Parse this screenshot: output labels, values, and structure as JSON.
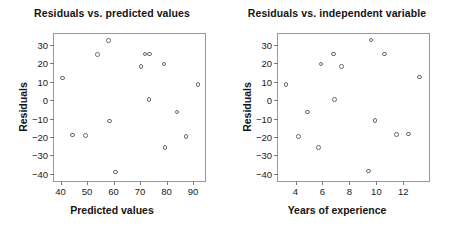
{
  "chart_data": [
    {
      "type": "scatter",
      "title": "Residuals vs. predicted values",
      "xlabel": "Predicted values",
      "ylabel": "Residuals",
      "xlim": [
        37.5,
        94.5
      ],
      "ylim": [
        -44,
        36
      ],
      "xticks": [
        40,
        50,
        60,
        70,
        80,
        90
      ],
      "yticks": [
        30,
        20,
        10,
        0,
        -10,
        -20,
        -30,
        -40
      ],
      "grid": false,
      "legend": null,
      "marker": "open-circle",
      "x": [
        40.6,
        44.4,
        49.5,
        54.0,
        58.0,
        58.4,
        60.8,
        70.4,
        71.8,
        73.4,
        73.6,
        79.0,
        79.4,
        83.9,
        87.3,
        91.9
      ],
      "y": [
        12.0,
        -19.0,
        -19.3,
        24.7,
        32.6,
        -11.4,
        -39.0,
        18.4,
        25.2,
        0.3,
        25.2,
        19.7,
        -25.9,
        -6.5,
        -19.9,
        8.4
      ],
      "n_points": 16
    },
    {
      "type": "scatter",
      "title": "Residuals vs. independent variable",
      "xlabel": "Years of experience",
      "ylabel": "Residuals",
      "xlim": [
        2.7,
        13.9
      ],
      "ylim": [
        -44,
        36
      ],
      "xticks": [
        4,
        6,
        8,
        10,
        12
      ],
      "yticks": [
        30,
        20,
        10,
        0,
        -10,
        -20,
        -30,
        -40
      ],
      "grid": false,
      "legend": null,
      "marker": "open-circle",
      "x": [
        3.3,
        4.2,
        4.9,
        5.7,
        5.9,
        6.8,
        6.9,
        7.4,
        9.4,
        9.6,
        9.9,
        10.6,
        11.5,
        12.4,
        13.2
      ],
      "y": [
        8.4,
        -19.7,
        -6.5,
        -25.9,
        19.7,
        25.2,
        0.3,
        18.4,
        -38.6,
        32.8,
        -11.0,
        25.2,
        -18.7,
        -18.5,
        12.5
      ],
      "n_points": 15
    }
  ],
  "figure": {
    "background": "#ffffff",
    "axis_color": "#9a9a9a",
    "marker_color": "#6b6b6b",
    "text_color": "#1a1a1a"
  }
}
